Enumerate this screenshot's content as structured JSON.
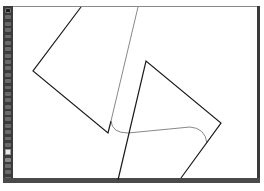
{
  "app": {
    "type": "vector-editor"
  },
  "toolbar": {
    "tools": [
      {
        "name": "selection-tool",
        "icon": "arrow-icon",
        "active": true
      },
      {
        "name": "direct-selection-tool",
        "icon": "hollow-arrow-icon"
      },
      {
        "name": "magic-wand-tool",
        "icon": "wand-icon"
      },
      {
        "name": "lasso-tool",
        "icon": "lasso-icon"
      },
      {
        "name": "pen-tool",
        "icon": "pen-icon"
      },
      {
        "name": "type-tool",
        "icon": "type-icon"
      },
      {
        "name": "line-tool",
        "icon": "line-icon"
      },
      {
        "name": "rectangle-tool",
        "icon": "rectangle-icon"
      },
      {
        "name": "paintbrush-tool",
        "icon": "brush-icon"
      },
      {
        "name": "pencil-tool",
        "icon": "pencil-icon"
      },
      {
        "name": "eraser-tool",
        "icon": "eraser-icon"
      },
      {
        "name": "rotate-tool",
        "icon": "rotate-icon"
      },
      {
        "name": "scale-tool",
        "icon": "scale-icon"
      },
      {
        "name": "width-tool",
        "icon": "width-icon"
      },
      {
        "name": "shape-builder-tool",
        "icon": "shape-builder-icon"
      },
      {
        "name": "perspective-tool",
        "icon": "perspective-icon"
      },
      {
        "name": "mesh-tool",
        "icon": "mesh-icon"
      },
      {
        "name": "gradient-tool",
        "icon": "gradient-icon"
      },
      {
        "name": "eyedropper-tool",
        "icon": "eyedropper-icon"
      },
      {
        "name": "blend-tool",
        "icon": "blend-icon"
      },
      {
        "name": "symbol-sprayer-tool",
        "icon": "sprayer-icon"
      },
      {
        "name": "graph-tool",
        "icon": "graph-icon"
      },
      {
        "name": "artboard-tool",
        "icon": "artboard-icon"
      },
      {
        "name": "hand-tool",
        "icon": "hand-icon"
      },
      {
        "name": "zoom-tool",
        "icon": "zoom-icon"
      }
    ],
    "fill_swatch": {
      "color": "#e8e8e8"
    },
    "stroke_swatch": {
      "color": "#222222"
    }
  },
  "canvas": {
    "background": "#ffffff",
    "shapes": [
      {
        "name": "left-polyline",
        "stroke": "#1a1a1a",
        "stroke_width": 1.2,
        "points": "81,7 33,71 108,133 111,121"
      },
      {
        "name": "thin-connector-line",
        "stroke": "#6a6a6a",
        "stroke_width": 0.8,
        "points": "138,7 111,121"
      },
      {
        "name": "rounded-connector-path",
        "stroke": "#6a6a6a",
        "stroke_width": 0.8,
        "d": "M111,121 Q112,133 128,133 L190,127 Q205,128 207,143"
      },
      {
        "name": "right-polyline",
        "stroke": "#1a1a1a",
        "stroke_width": 1.2,
        "points": "118,180 146,61 221,123 181,178"
      }
    ]
  },
  "status_bar": {
    "items": [
      "",
      "",
      ""
    ]
  }
}
